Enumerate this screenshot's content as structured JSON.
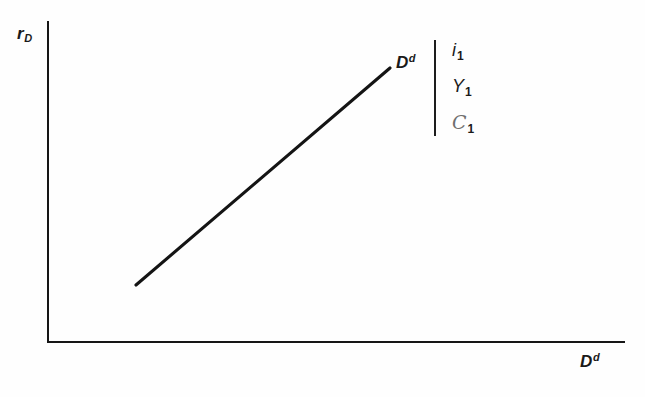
{
  "figure": {
    "background_color": "#fefefe",
    "ink_color": "#161616"
  },
  "axes": {
    "y_label": "r",
    "y_label_sub": "D",
    "x_label": "D",
    "x_label_sup": "d"
  },
  "curve": {
    "label": "D",
    "label_sup": "d",
    "color": "#141414"
  },
  "annotation": {
    "items": [
      {
        "symbol": "i",
        "sub": "1",
        "style": "italic"
      },
      {
        "symbol": "Y",
        "sub": "1",
        "style": "italic"
      },
      {
        "symbol": "C",
        "sub": "1",
        "style": "script"
      }
    ]
  },
  "chart_data": {
    "type": "line",
    "title": "",
    "xlabel": "D^d",
    "ylabel": "r_D",
    "xlim": [
      0,
      100
    ],
    "ylim": [
      0,
      100
    ],
    "grid": false,
    "legend": "none",
    "axis_ticks": {
      "x": [],
      "y": []
    },
    "series": [
      {
        "name": "D^d",
        "label": "D^d",
        "slope": "positive",
        "x": [
          15,
          59
        ],
        "y": [
          17,
          85
        ],
        "points_px": [
          [
            136,
            285
          ],
          [
            390,
            68
          ]
        ],
        "color": "#141414"
      }
    ],
    "annotations": [
      {
        "text": "D^d",
        "position_px": [
          396,
          52
        ],
        "role": "curve-label"
      },
      {
        "text": "i_1",
        "position_px": [
          458,
          44
        ],
        "role": "held-constant"
      },
      {
        "text": "Y_1",
        "position_px": [
          458,
          76
        ],
        "role": "held-constant"
      },
      {
        "text": "C_1",
        "position_px": [
          458,
          108
        ],
        "role": "held-constant"
      }
    ]
  }
}
